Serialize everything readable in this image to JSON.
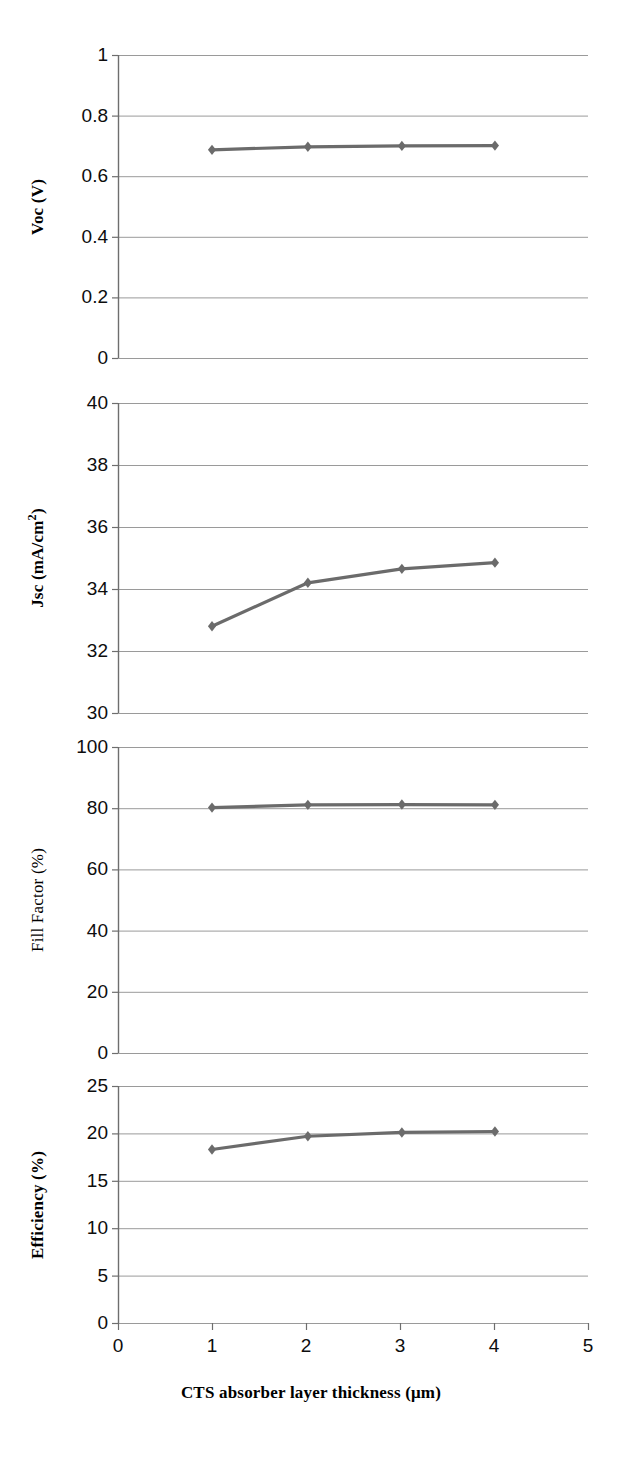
{
  "chart_data": [
    {
      "type": "line",
      "title": "",
      "xlabel": "CTS absorber layer thickness (μm)",
      "ylabel": "Voc (V)",
      "ylabel_parts": {
        "main": "Voc (V)",
        "sup": ""
      },
      "xlim": [
        0,
        5
      ],
      "ylim": [
        0,
        1
      ],
      "xticks": [
        "0",
        "1",
        "2",
        "3",
        "4",
        "5"
      ],
      "yticks": [
        "0",
        "0.2",
        "0.4",
        "0.6",
        "0.8",
        "1"
      ],
      "grid": true,
      "legend": "none",
      "series": [
        {
          "name": "Voc",
          "x": [
            1.0,
            2.02,
            3.02,
            4.01
          ],
          "values": [
            0.687,
            0.697,
            0.7,
            0.701
          ]
        }
      ]
    },
    {
      "type": "line",
      "title": "",
      "xlabel": "CTS absorber layer thickness (μm)",
      "ylabel": "Jsc (mA/cm2)",
      "ylabel_parts": {
        "main": "Jsc (mA/cm",
        "sup": "2",
        "tail": ")"
      },
      "xlim": [
        0,
        5
      ],
      "ylim": [
        30,
        40
      ],
      "xticks": [
        "0",
        "1",
        "2",
        "3",
        "4",
        "5"
      ],
      "yticks": [
        "30",
        "32",
        "34",
        "36",
        "38",
        "40"
      ],
      "grid": true,
      "legend": "none",
      "series": [
        {
          "name": "Jsc",
          "x": [
            1.0,
            2.02,
            3.02,
            4.01
          ],
          "values": [
            32.8,
            34.2,
            34.65,
            34.85
          ]
        }
      ]
    },
    {
      "type": "line",
      "title": "",
      "xlabel": "CTS absorber layer thickness (μm)",
      "ylabel": "Fill Factor (%)",
      "ylabel_parts": {
        "main": "Fill Factor (%)",
        "sup": ""
      },
      "xlim": [
        0,
        5
      ],
      "ylim": [
        0,
        100
      ],
      "xticks": [
        "0",
        "1",
        "2",
        "3",
        "4",
        "5"
      ],
      "yticks": [
        "0",
        "20",
        "40",
        "60",
        "80",
        "100"
      ],
      "grid": true,
      "legend": "none",
      "series": [
        {
          "name": "Fill Factor",
          "x": [
            1.0,
            2.02,
            3.02,
            4.01
          ],
          "values": [
            80.2,
            81.1,
            81.2,
            81.1
          ]
        }
      ]
    },
    {
      "type": "line",
      "title": "",
      "xlabel": "CTS absorber layer thickness (μm)",
      "ylabel": "Efficiency (%)",
      "ylabel_parts": {
        "main": "Efficiency (%)",
        "sup": ""
      },
      "xlim": [
        0,
        5
      ],
      "ylim": [
        0,
        25
      ],
      "xticks": [
        "0",
        "1",
        "2",
        "3",
        "4",
        "5"
      ],
      "yticks": [
        "0",
        "5",
        "10",
        "15",
        "20",
        "25"
      ],
      "grid": true,
      "legend": "none",
      "series": [
        {
          "name": "Efficiency",
          "x": [
            1.0,
            2.02,
            3.02,
            4.01
          ],
          "values": [
            18.3,
            19.7,
            20.1,
            20.2
          ]
        }
      ]
    }
  ],
  "figure": {
    "xaxis_title": "CTS absorber layer thickness (μm)",
    "xtick_labels": [
      "0",
      "1",
      "2",
      "3",
      "4",
      "5"
    ],
    "panels": [
      {
        "key": "voc",
        "ylabel": "Voc (V)",
        "ylabel_main": "Voc (V)",
        "ylabel_sup": "",
        "ylabel_tail": "",
        "ylabel_weight": "bold",
        "yticks": [
          "1",
          "0.8",
          "0.6",
          "0.4",
          "0.2",
          "0"
        ]
      },
      {
        "key": "jsc",
        "ylabel": "Jsc (mA/cm2)",
        "ylabel_main": "Jsc (mA/cm",
        "ylabel_sup": "2",
        "ylabel_tail": ")",
        "ylabel_weight": "bold",
        "yticks": [
          "40",
          "38",
          "36",
          "34",
          "32",
          "30"
        ]
      },
      {
        "key": "fill-factor",
        "ylabel": "Fill Factor (%)",
        "ylabel_main": "Fill Factor (%)",
        "ylabel_sup": "",
        "ylabel_tail": "",
        "ylabel_weight": "regular",
        "yticks": [
          "100",
          "80",
          "60",
          "40",
          "20",
          "0"
        ]
      },
      {
        "key": "efficiency",
        "ylabel": "Efficiency (%)",
        "ylabel_main": "Efficiency (%)",
        "ylabel_sup": "",
        "ylabel_tail": "",
        "ylabel_weight": "bold",
        "yticks": [
          "25",
          "20",
          "15",
          "10",
          "5",
          "0"
        ]
      }
    ],
    "colors": {
      "series": "#6b6b6b",
      "grid": "#9a9a9a",
      "axis": "#6e6e6e",
      "text": "#0d0d0d"
    }
  }
}
